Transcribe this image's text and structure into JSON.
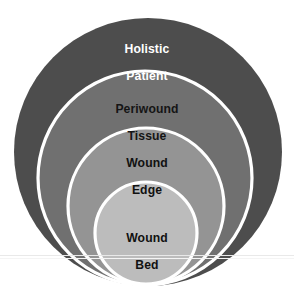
{
  "diagram": {
    "type": "concentric-circles",
    "orientation": "bottom-aligned nested circles, largest outermost",
    "background_color": "#ffffff",
    "ring_stroke_color": "#ffffff",
    "rings": [
      {
        "id": "holistic-patient",
        "order": 1,
        "level": "outermost",
        "label_line1": "Holistic",
        "label_line2": "Patient",
        "fill_color": "#4d4d4d",
        "text_color": "#ffffff"
      },
      {
        "id": "periwound-tissue",
        "order": 2,
        "level": "second",
        "label_line1": "Periwound",
        "label_line2": "Tissue",
        "fill_color": "#707070",
        "text_color": "#151515"
      },
      {
        "id": "wound-edge",
        "order": 3,
        "level": "third",
        "label_line1": "Wound",
        "label_line2": "Edge",
        "fill_color": "#949494",
        "text_color": "#111111"
      },
      {
        "id": "wound-bed",
        "order": 4,
        "level": "innermost",
        "label_line1": "Wound",
        "label_line2": "Bed",
        "fill_color": "#bcbcbc",
        "text_color": "#111111"
      }
    ]
  }
}
